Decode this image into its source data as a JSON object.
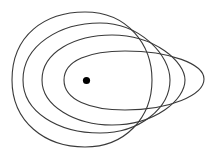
{
  "diagram": {
    "width": 214,
    "height": 155,
    "background": "#ffffff",
    "stroke_color": "#3a3a3a",
    "stroke_width": 1.1,
    "point": {
      "cx": 86.5,
      "cy": 80.5,
      "r": 3.6,
      "fill": "#000000"
    },
    "curves": [
      {
        "id": "contour-1",
        "d": "M 12 80 C 12 35, 45 12, 85 12 C 128 12, 152 45, 152 80 C 152 118, 125 147, 85 147 C 45 147, 12 122, 12 80 Z"
      },
      {
        "id": "contour-2",
        "d": "M 23 80 C 23 45, 60 23, 100 23 C 140 23, 170 55, 170 80 C 170 108, 140 133, 100 133 C 58 133, 23 112, 23 80 Z"
      },
      {
        "id": "contour-3",
        "d": "M 42 80 C 42 52, 75 35, 112 35 C 155 35, 185 62, 185 80 C 185 100, 155 125, 112 125 C 75 125, 42 106, 42 80 Z"
      },
      {
        "id": "contour-4",
        "d": "M 64 80 C 64 60, 90 51, 125 51 C 170 51, 204 64, 204 79 C 204 95, 170 110, 125 110 C 90 110, 64 100, 64 80 Z"
      }
    ]
  }
}
